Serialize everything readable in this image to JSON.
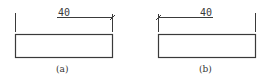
{
  "figures": [
    {
      "id": "a",
      "caption": "(a)",
      "dimension_label": "40",
      "tick_end": "right"
    },
    {
      "id": "b",
      "caption": "(b)",
      "dimension_label": "40",
      "tick_end": "left"
    }
  ],
  "colors": {
    "stroke": "#3a3a3a",
    "background": "#ffffff"
  }
}
